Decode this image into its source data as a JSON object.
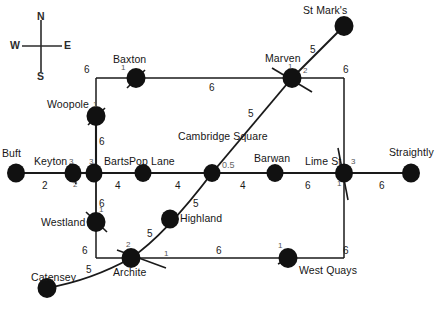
{
  "diagram": {
    "compass": {
      "north": "N",
      "south": "S",
      "east": "E",
      "west": "W"
    },
    "stations": [
      {
        "id": "buft",
        "name": "Buft",
        "x": 16,
        "y": 173
      },
      {
        "id": "keyton",
        "name": "Keyton",
        "x": 73,
        "y": 173,
        "num": "3",
        "num2": "2"
      },
      {
        "id": "barts",
        "name": "Barts",
        "x": 93,
        "y": 173,
        "num": "3"
      },
      {
        "id": "poplane",
        "name": "Pop Lane",
        "x": 143,
        "y": 173
      },
      {
        "id": "cambridge",
        "name": "Cambridge Square",
        "x": 212,
        "y": 173,
        "num": "0.5"
      },
      {
        "id": "barwan",
        "name": "Barwan",
        "x": 275,
        "y": 173
      },
      {
        "id": "limest",
        "name": "Lime St",
        "x": 344,
        "y": 173,
        "num": "3",
        "num2": "1"
      },
      {
        "id": "straightly",
        "name": "Straightly",
        "x": 411,
        "y": 173
      },
      {
        "id": "woopole",
        "name": "Woopole",
        "x": 96,
        "y": 116,
        "num": "1"
      },
      {
        "id": "baxton",
        "name": "Baxton",
        "x": 136,
        "y": 78,
        "num": "1"
      },
      {
        "id": "marven",
        "name": "Marven",
        "x": 292,
        "y": 78,
        "num": "1",
        "num2": "2"
      },
      {
        "id": "stmarks",
        "name": "St Mark's",
        "x": 344,
        "y": 26
      },
      {
        "id": "highland",
        "name": "Highland",
        "x": 170,
        "y": 219
      },
      {
        "id": "westland",
        "name": "Westland",
        "x": 96,
        "y": 222,
        "num": "1"
      },
      {
        "id": "archite",
        "name": "Archite",
        "x": 131,
        "y": 258,
        "num": "2",
        "num2": "1"
      },
      {
        "id": "westquays",
        "name": "West Quays",
        "x": 288,
        "y": 258,
        "num": "1"
      },
      {
        "id": "catensey",
        "name": "Catensey",
        "x": 47,
        "y": 288
      }
    ],
    "edges": [
      {
        "from": "buft",
        "to": "keyton",
        "weight": "2"
      },
      {
        "from": "barts",
        "to": "poplane",
        "weight": "4"
      },
      {
        "from": "poplane",
        "to": "cambridge",
        "weight": "4"
      },
      {
        "from": "cambridge",
        "to": "barwan",
        "weight": "4"
      },
      {
        "from": "barwan",
        "to": "limest",
        "weight": "6"
      },
      {
        "from": "limest",
        "to": "straightly",
        "weight": "6"
      },
      {
        "from": "woopole",
        "to": "baxton",
        "weight": "6"
      },
      {
        "from": "baxton",
        "to": "marven",
        "weight": "6"
      },
      {
        "from": "barts",
        "to": "woopole",
        "weight": "6"
      },
      {
        "from": "barts",
        "to": "westland",
        "weight": "6"
      },
      {
        "from": "westland",
        "to": "archite",
        "weight": "6"
      },
      {
        "from": "archite",
        "to": "westquays",
        "weight": "6"
      },
      {
        "from": "marven",
        "to": "limest",
        "weight": "6"
      },
      {
        "from": "westquays",
        "to": "limest",
        "weight": "6"
      },
      {
        "from": "marven",
        "to": "stmarks",
        "weight": "5"
      },
      {
        "from": "cambridge",
        "to": "marven",
        "weight": "5"
      },
      {
        "from": "highland",
        "to": "cambridge",
        "weight": "5"
      },
      {
        "from": "archite",
        "to": "highland",
        "weight": "5"
      },
      {
        "from": "catensey",
        "to": "archite",
        "weight": "5"
      }
    ],
    "edge_labels": [
      {
        "id": "w-buft-keyton",
        "text": "2",
        "x": 42,
        "y": 186
      },
      {
        "id": "w-barts-poplane",
        "text": "4",
        "x": 115,
        "y": 186
      },
      {
        "id": "w-poplane-cambridge",
        "text": "4",
        "x": 175,
        "y": 186
      },
      {
        "id": "w-cambridge-barwan",
        "text": "4",
        "x": 240,
        "y": 186
      },
      {
        "id": "w-barwan-limest",
        "text": "6",
        "x": 305,
        "y": 186
      },
      {
        "id": "w-limest-straightly",
        "text": "6",
        "x": 379,
        "y": 186
      },
      {
        "id": "w-barts-woopole",
        "text": "6",
        "x": 99,
        "y": 142
      },
      {
        "id": "w-woopole-baxton",
        "text": "6",
        "x": 88,
        "y": 70
      },
      {
        "id": "w-baxton-marven",
        "text": "6",
        "x": 209,
        "y": 87
      },
      {
        "id": "w-marven-limest",
        "text": "6",
        "x": 345,
        "y": 70
      },
      {
        "id": "w-barts-westland",
        "text": "6",
        "x": 99,
        "y": 203
      },
      {
        "id": "w-westland-archite",
        "text": "6",
        "x": 84,
        "y": 250
      },
      {
        "id": "w-archite-quays",
        "text": "6",
        "x": 216,
        "y": 250
      },
      {
        "id": "w-quays-limest",
        "text": "6",
        "x": 345,
        "y": 250
      },
      {
        "id": "w-marven-stmarks",
        "text": "5",
        "x": 310,
        "y": 50
      },
      {
        "id": "w-cambridge-marven",
        "text": "5",
        "x": 248,
        "y": 114
      },
      {
        "id": "w-highland-cambridge",
        "text": "5",
        "x": 193,
        "y": 204
      },
      {
        "id": "w-archite-highland",
        "text": "5",
        "x": 148,
        "y": 233
      },
      {
        "id": "w-catensey-archite",
        "text": "5",
        "x": 87,
        "y": 270
      },
      {
        "id": "w-cambridge-junction",
        "text": "0.5",
        "x": 226,
        "y": 166
      }
    ]
  }
}
